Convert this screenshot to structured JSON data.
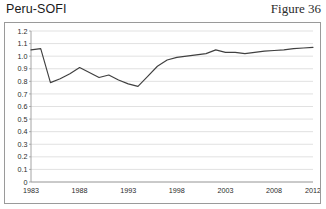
{
  "header": {
    "title": "Peru-SOFI",
    "figure_label": "Figure 36"
  },
  "chart_data": {
    "type": "line",
    "title": "Peru-SOFI",
    "xlabel": "",
    "ylabel": "",
    "xlim": [
      1983,
      2012
    ],
    "ylim": [
      0,
      1.2
    ],
    "grid": true,
    "legend": false,
    "line_color": "#404040",
    "grid_color": "#d9d9d9",
    "axis_color": "#9a9a9a",
    "y_ticks": [
      "0",
      "0.1",
      "0.2",
      "0.3",
      "0.4",
      "0.5",
      "0.6",
      "0.7",
      "0.8",
      "0.9",
      "1.0",
      "1.1",
      "1.2"
    ],
    "y_tick_values": [
      0,
      0.1,
      0.2,
      0.3,
      0.4,
      0.5,
      0.6,
      0.7,
      0.8,
      0.9,
      1.0,
      1.1,
      1.2
    ],
    "x_ticks": [
      "1983",
      "1988",
      "1993",
      "1998",
      "2003",
      "2008",
      "2012"
    ],
    "x_tick_values": [
      1983,
      1988,
      1993,
      1998,
      2003,
      2008,
      2012
    ],
    "series": [
      {
        "name": "Peru-SOFI",
        "x": [
          1983,
          1984,
          1985,
          1986,
          1987,
          1988,
          1989,
          1990,
          1991,
          1992,
          1993,
          1994,
          1995,
          1996,
          1997,
          1998,
          1999,
          2000,
          2001,
          2002,
          2003,
          2004,
          2005,
          2006,
          2007,
          2008,
          2009,
          2010,
          2011,
          2012
        ],
        "values": [
          1.05,
          1.06,
          0.79,
          0.82,
          0.86,
          0.91,
          0.87,
          0.83,
          0.85,
          0.81,
          0.78,
          0.76,
          0.84,
          0.92,
          0.97,
          0.99,
          1.0,
          1.01,
          1.02,
          1.05,
          1.03,
          1.03,
          1.02,
          1.03,
          1.04,
          1.045,
          1.05,
          1.06,
          1.065,
          1.07
        ]
      }
    ]
  }
}
